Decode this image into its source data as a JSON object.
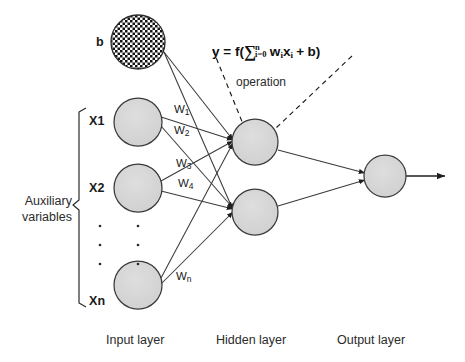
{
  "diagram": {
    "bias_label": "b",
    "aux_label_line1": "Auxiliary",
    "aux_label_line2": "variables",
    "operation_label": "operation",
    "formula": {
      "lhs": "y = f(",
      "sigma": "∑",
      "sum_upper": "n",
      "sum_lower": "i=0",
      "w": "w",
      "w_sub": "i",
      "x": "x",
      "x_sub": "i",
      "plus": "+",
      "b": "b",
      "rhs": ")"
    },
    "input_nodes": [
      {
        "label": "X1",
        "cx": 138,
        "cy": 122,
        "r": 24
      },
      {
        "label": "X2",
        "cx": 138,
        "cy": 188,
        "r": 24
      },
      {
        "label": "Xn",
        "cx": 138,
        "cy": 285,
        "r": 24
      }
    ],
    "bias_node": {
      "label": "b",
      "cx": 138,
      "cy": 42,
      "r": 27
    },
    "hidden_nodes": [
      {
        "cx": 255,
        "cy": 142,
        "r": 23
      },
      {
        "cx": 255,
        "cy": 212,
        "r": 23
      }
    ],
    "output_nodes": [
      {
        "cx": 385,
        "cy": 176,
        "r": 21
      }
    ],
    "weights": [
      {
        "label": "W",
        "sub": "1",
        "x": 176,
        "y": 110
      },
      {
        "label": "W",
        "sub": "2",
        "x": 176,
        "y": 131
      },
      {
        "label": "W",
        "sub": "3",
        "x": 176,
        "y": 163
      },
      {
        "label": "W",
        "sub": "4",
        "x": 176,
        "y": 183
      },
      {
        "label": "W",
        "sub": "n",
        "x": 176,
        "y": 274
      }
    ],
    "layer_labels": [
      {
        "text": "Input layer",
        "x": 106,
        "y": 333
      },
      {
        "text": "Hidden layer",
        "x": 216,
        "y": 333
      },
      {
        "text": "Output layer",
        "x": 337,
        "y": 333
      }
    ],
    "ellipsis_dots": {
      "columns": [
        100,
        138
      ],
      "rows": [
        226,
        245,
        264
      ]
    },
    "colors": {
      "node_fill": "#d2d2d2",
      "node_stroke": "#3a3a3a",
      "bias_fill": "#ffffff",
      "bias_pattern": "#1a1a1a",
      "edge": "#3a3a3a",
      "dashed_edge": "#1a1a1a",
      "text": "#1a1a1a",
      "background": "#ffffff"
    }
  }
}
